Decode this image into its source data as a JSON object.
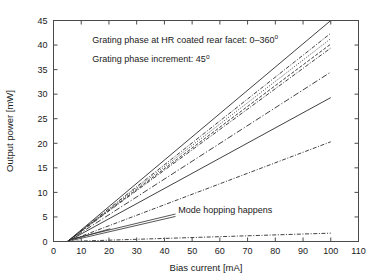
{
  "chart_data": {
    "type": "line",
    "title": "",
    "xlabel": "Bias current [mA]",
    "ylabel": "Output power [mW]",
    "xlim": [
      0,
      110
    ],
    "ylim": [
      0,
      45
    ],
    "xticks": [
      0,
      10,
      20,
      30,
      40,
      50,
      60,
      70,
      80,
      90,
      100,
      110
    ],
    "yticks": [
      0,
      5,
      10,
      15,
      20,
      25,
      30,
      35,
      40,
      45
    ],
    "grid": false,
    "legend": "none",
    "annotations": [
      {
        "id": "grating-phase-range",
        "text": "Grating phase at HR coated rear facet: 0–360",
        "superscript": "o",
        "x": 14,
        "y": 40.5
      },
      {
        "id": "grating-phase-increment",
        "text": "Grating phase increment: 45",
        "superscript": "o",
        "x": 14,
        "y": 36.6
      },
      {
        "id": "mode-hopping",
        "text": "Mode hopping happens",
        "superscript": "",
        "x": 45,
        "y": 5.9
      }
    ],
    "threshold_current_mA": 5,
    "series": [
      {
        "name": "phase-000",
        "style": "solid",
        "color": "#b4b4b4",
        "x": [
          5,
          100
        ],
        "values": [
          0,
          45.0
        ],
        "slope_mW_per_mA": 0.474
      },
      {
        "name": "phase-045",
        "style": "dashdot",
        "color": "#3a3a3a",
        "x": [
          5,
          100
        ],
        "values": [
          0,
          42.4
        ],
        "slope_mW_per_mA": 0.446
      },
      {
        "name": "phase-090",
        "style": "dotted",
        "color": "#3a3a3a",
        "x": [
          5,
          100
        ],
        "values": [
          0,
          41.3
        ],
        "slope_mW_per_mA": 0.435
      },
      {
        "name": "phase-135",
        "style": "dashed",
        "color": "#3a3a3a",
        "x": [
          5,
          100
        ],
        "values": [
          0,
          40.2
        ],
        "slope_mW_per_mA": 0.423
      },
      {
        "name": "phase-180",
        "style": "dashdot",
        "color": "#3a3a3a",
        "x": [
          5,
          100
        ],
        "values": [
          0,
          39.4
        ],
        "slope_mW_per_mA": 0.415
      },
      {
        "name": "phase-225",
        "style": "dashdot-long",
        "color": "#3a3a3a",
        "x": [
          5,
          100
        ],
        "values": [
          0,
          34.5
        ],
        "slope_mW_per_mA": 0.363
      },
      {
        "name": "phase-270",
        "style": "solid",
        "color": "#2b2b2b",
        "x": [
          5,
          100
        ],
        "values": [
          0,
          29.3
        ],
        "slope_mW_per_mA": 0.308
      },
      {
        "name": "phase-315",
        "style": "dashdot",
        "color": "#3a3a3a",
        "x": [
          5,
          100
        ],
        "values": [
          0,
          20.3
        ],
        "slope_mW_per_mA": 0.214
      },
      {
        "name": "phase-360",
        "style": "dashdot",
        "color": "#3a3a3a",
        "x": [
          5,
          100
        ],
        "values": [
          0,
          1.7
        ],
        "slope_mW_per_mA": 0.018
      }
    ],
    "leader_lines": [
      {
        "id": "leader-upper",
        "from_x": 44,
        "from_y": 5.6,
        "to_x": 6.5,
        "to_y": 0.5
      },
      {
        "id": "leader-lower",
        "from_x": 44,
        "from_y": 5.1,
        "to_x": 6.5,
        "to_y": 0.2
      },
      {
        "id": "leader-mid",
        "from_x": 20.5,
        "from_y": 2.6,
        "to_x": 6.5,
        "to_y": 0.35
      }
    ]
  }
}
